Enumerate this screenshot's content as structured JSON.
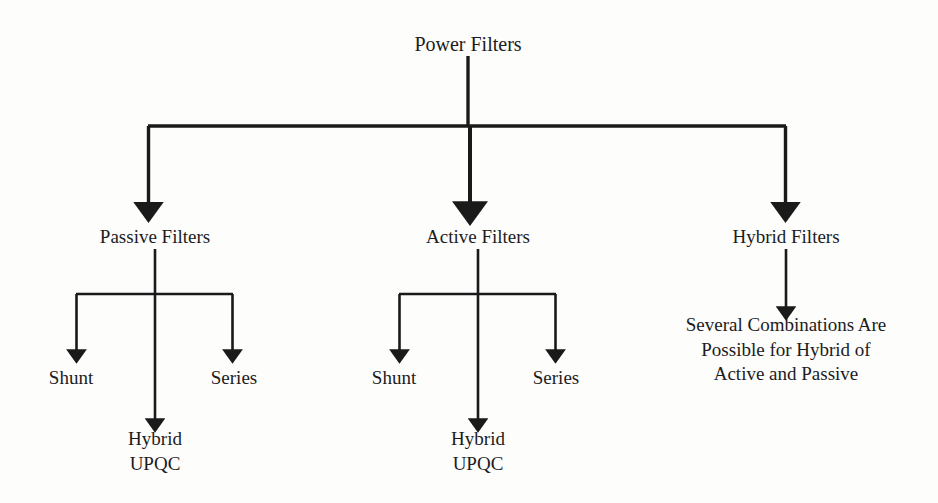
{
  "diagram": {
    "type": "tree",
    "background_color": "#fdfdfc",
    "line_color": "#1a1a1a",
    "text_color": "#1c1c1c",
    "root": {
      "label": "Power Filters",
      "x": 468,
      "y": 44
    },
    "level1": [
      {
        "key": "passive",
        "label": "Passive Filters",
        "x": 155,
        "y": 236
      },
      {
        "key": "active",
        "label": "Active Filters",
        "x": 478,
        "y": 236
      },
      {
        "key": "hybrid",
        "label": "Hybrid Filters",
        "x": 786,
        "y": 236
      }
    ],
    "level2": [
      {
        "key": "passive-shunt",
        "parent": "passive",
        "label": "Shunt",
        "x": 71,
        "y": 377
      },
      {
        "key": "passive-series",
        "parent": "passive",
        "label": "Series",
        "x": 234,
        "y": 377
      },
      {
        "key": "active-shunt",
        "parent": "active",
        "label": "Shunt",
        "x": 394,
        "y": 377
      },
      {
        "key": "active-series",
        "parent": "active",
        "label": "Series",
        "x": 556,
        "y": 377
      }
    ],
    "leaves": [
      {
        "key": "passive-hybrid-upqc",
        "parent": "passive",
        "lines": [
          "Hybrid",
          "UPQC"
        ],
        "x": 155,
        "y": 438
      },
      {
        "key": "active-hybrid-upqc",
        "parent": "active",
        "lines": [
          "Hybrid",
          "UPQC"
        ],
        "x": 478,
        "y": 438
      },
      {
        "key": "hybrid-combinations",
        "parent": "hybrid",
        "lines": [
          "Several Combinations Are",
          "Possible for Hybrid of",
          "Active and Passive"
        ],
        "x": 786,
        "y": 324
      }
    ]
  }
}
